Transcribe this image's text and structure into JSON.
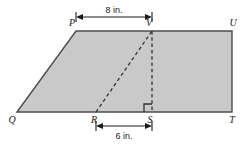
{
  "figure": {
    "shape_name": "parallelogram",
    "fill_color": "#c9c9c9",
    "stroke_color": "#4d4d4d",
    "dashed_color": "#333333",
    "dimension_color": "#1a1a1a",
    "background_color": "#ffffff"
  },
  "vertices": [
    {
      "name": "vertex-p",
      "label": "P",
      "x": 76,
      "y": 31,
      "label_x": 72,
      "label_y": 26
    },
    {
      "name": "vertex-v",
      "label": "V",
      "x": 152,
      "y": 31,
      "label_x": 148,
      "label_y": 26
    },
    {
      "name": "vertex-u",
      "label": "U",
      "x": 232,
      "y": 31,
      "label_x": 228,
      "label_y": 26
    },
    {
      "name": "vertex-q",
      "label": "Q",
      "x": 17,
      "y": 112,
      "label_x": 12,
      "label_y": 122
    },
    {
      "name": "vertex-r",
      "label": "R",
      "x": 96,
      "y": 112,
      "label_x": 92,
      "label_y": 122
    },
    {
      "name": "vertex-s",
      "label": "S",
      "x": 152,
      "y": 112,
      "label_x": 148,
      "label_y": 122
    },
    {
      "name": "vertex-t",
      "label": "T",
      "x": 232,
      "y": 112,
      "label_x": 228,
      "label_y": 122
    }
  ],
  "dimensions": {
    "top": {
      "label": "8 in.",
      "from_vertex": "P",
      "to_vertex": "V",
      "x1": 76,
      "x2": 152,
      "y": 17,
      "text_x": 114,
      "text_y": 13
    },
    "bottom": {
      "label": "6 in.",
      "from_vertex": "R",
      "to_vertex": "S",
      "x1": 96,
      "x2": 152,
      "y": 126,
      "text_x": 124,
      "text_y": 139
    }
  },
  "dashed_segments": [
    {
      "name": "segment-r-v",
      "x1": 96,
      "y1": 112,
      "x2": 152,
      "y2": 31
    },
    {
      "name": "segment-v-s",
      "x1": 152,
      "y1": 31,
      "x2": 152,
      "y2": 112
    }
  ],
  "right_angle": {
    "name": "right-angle-marker-at-s",
    "vertex": "S",
    "size": 8
  },
  "outline_path": "M 17 112 L 76 31 L 232 31 L 232 112 Z"
}
